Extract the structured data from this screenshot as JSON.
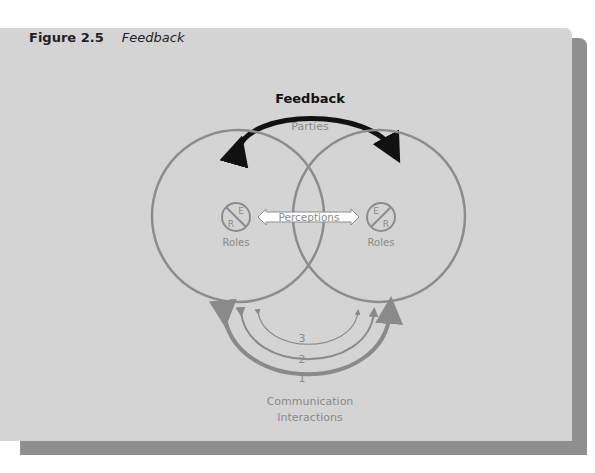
{
  "figure": {
    "number": "Figure 2.5",
    "title": "Feedback"
  },
  "diagram": {
    "feedback_label": "Feedback",
    "parties_label": "Parties",
    "perceptions_label": "Perceptions",
    "left_role": {
      "top_letter": "E",
      "bottom_letter": "R",
      "label": "Roles"
    },
    "right_role": {
      "top_letter": "E",
      "bottom_letter": "R",
      "label": "Roles"
    },
    "interaction_levels": [
      "3",
      "2",
      "1"
    ],
    "communication_label_line1": "Communication",
    "communication_label_line2": "Interactions"
  },
  "colors": {
    "panel": "#d4d4d4",
    "shadow": "#8f8f8f",
    "circle_stroke": "#8c8c8c",
    "feedback_arrow": "#111111",
    "perceptions_box": "#ffffff"
  }
}
